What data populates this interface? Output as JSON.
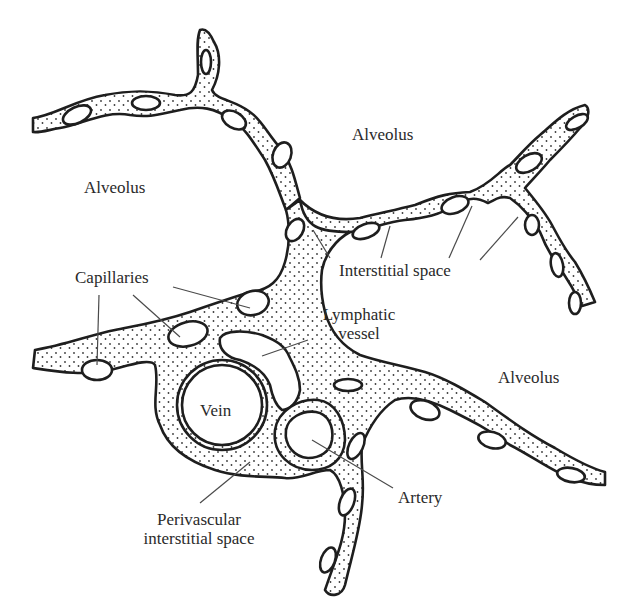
{
  "labels": {
    "alveolus_top": "Alveolus",
    "alveolus_left": "Alveolus",
    "alveolus_right": "Alveolus",
    "capillaries": "Capillaries",
    "interstitial_space": "Interstitial space",
    "lymphatic_line1": "Lymphatic",
    "lymphatic_line2": "vessel",
    "vein": "Vein",
    "artery": "Artery",
    "perivascular_line1": "Perivascular",
    "perivascular_line2": "interstitial space"
  },
  "colors": {
    "outline": "#1e1e1e",
    "stipple": "#3a3a3a",
    "fill": "#ffffff",
    "leader": "#4a4a4a",
    "text": "#2a2a2a"
  }
}
